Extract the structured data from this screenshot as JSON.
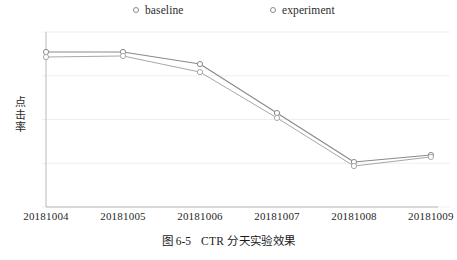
{
  "figure": {
    "caption_number": "图 6-5",
    "caption_text": "CTR 分天实验效果"
  },
  "legend": {
    "position": "top-center",
    "entries": [
      {
        "label": "baseline",
        "marker": "open-circle",
        "color": "#8a8a8a"
      },
      {
        "label": "experiment",
        "marker": "open-circle",
        "color": "#a8a8a8"
      }
    ]
  },
  "axis": {
    "ylabel": "点击率",
    "ylabel_chars": [
      "点",
      "击",
      "率"
    ],
    "xtick_labels": [
      "20181004",
      "20181005",
      "20181006",
      "20181007",
      "20181008",
      "20181009"
    ]
  },
  "chart_data": {
    "type": "line",
    "title": "CTR 分天实验效果",
    "xlabel": "",
    "ylabel": "点击率",
    "categories": [
      "20181004",
      "20181005",
      "20181006",
      "20181007",
      "20181008",
      "20181009"
    ],
    "series": [
      {
        "name": "baseline",
        "color": "#8a8a8a",
        "marker": "open-circle",
        "values": [
          0.886,
          0.886,
          0.817,
          0.537,
          0.257,
          0.297
        ]
      },
      {
        "name": "experiment",
        "color": "#a8a8a8",
        "marker": "open-circle",
        "values": [
          0.857,
          0.863,
          0.771,
          0.509,
          0.234,
          0.286
        ]
      }
    ],
    "ylim": [
      0,
      1
    ],
    "yticks_visible": false,
    "grid": "horizontal",
    "gridline_values": [
      1.0,
      0.75,
      0.5,
      0.25,
      0.0
    ],
    "legend_position": "top-center"
  },
  "colors": {
    "baseline_line": "#8a8a8a",
    "experiment_line": "#b0b0b0",
    "gridline": "#efefef",
    "axis": "#b9b9b9",
    "text": "#1a1a1a",
    "background": "#ffffff"
  }
}
